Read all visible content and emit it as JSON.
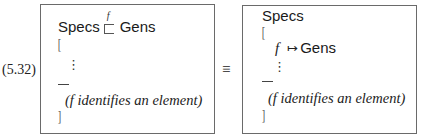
{
  "equation_number": "(5.32)",
  "equivalence_symbol": "≡",
  "left_box": {
    "head_left": "Specs",
    "arrow_label": "f",
    "arrow_symbol": "⊑",
    "head_right": "Gens",
    "open_bracket": "[",
    "vdots": "⋮",
    "separator": "—",
    "comment": "(f identifies an element)",
    "close_bracket": "]"
  },
  "right_box": {
    "head": "Specs",
    "open_bracket": "[",
    "entry_var": "f",
    "entry_arrow": "↦",
    "entry_target": "Gens",
    "vdots": "⋮",
    "separator": "—",
    "comment": "(f identifies an element)",
    "close_bracket": "]"
  }
}
